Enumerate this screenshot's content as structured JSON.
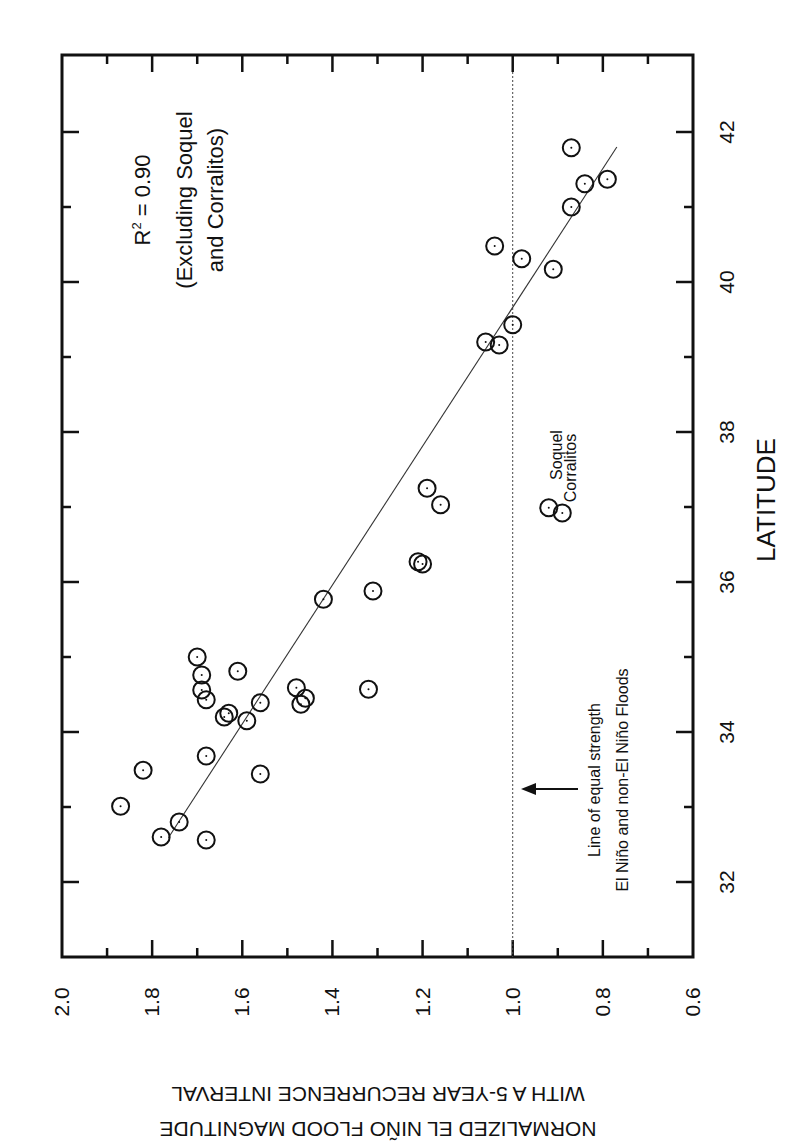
{
  "chart_data": {
    "type": "scatter",
    "orientation_note": "figure rotated 90 degrees clockwise on page",
    "title": "",
    "xlabel": "LATITUDE",
    "ylabel": [
      "NORMALIZED EL NIÑO FLOOD MAGNITUDE",
      "WITH A 5-YEAR RECURRENCE INTERVAL"
    ],
    "xlim": [
      31.0,
      43.0
    ],
    "ylim": [
      0.6,
      2.0
    ],
    "x_ticks": [
      32,
      34,
      36,
      38,
      40,
      42
    ],
    "x_minor_ticks": [
      33,
      35,
      37,
      39,
      41
    ],
    "y_ticks": [
      "2.0",
      "1.8",
      "1.6",
      "1.4",
      "1.2",
      "1.0",
      "0.8",
      "0.6"
    ],
    "y_tick_values": [
      2.0,
      1.8,
      1.6,
      1.4,
      1.2,
      1.0,
      0.8,
      0.6
    ],
    "y_minor_ticks": [
      1.9,
      1.7,
      1.5,
      1.3,
      1.1,
      0.9,
      0.7
    ],
    "grid": false,
    "series": [
      {
        "name": "Stations",
        "marker": "circle-dot",
        "points": [
          {
            "x": 35.0,
            "y": 1.7
          },
          {
            "x": 34.76,
            "y": 1.69
          },
          {
            "x": 34.56,
            "y": 1.69
          },
          {
            "x": 34.43,
            "y": 1.68
          },
          {
            "x": 34.81,
            "y": 1.61
          },
          {
            "x": 34.25,
            "y": 1.63
          },
          {
            "x": 34.2,
            "y": 1.64
          },
          {
            "x": 34.15,
            "y": 1.59
          },
          {
            "x": 34.39,
            "y": 1.56
          },
          {
            "x": 33.68,
            "y": 1.68
          },
          {
            "x": 33.49,
            "y": 1.82
          },
          {
            "x": 33.44,
            "y": 1.56
          },
          {
            "x": 33.01,
            "y": 1.87
          },
          {
            "x": 32.8,
            "y": 1.74
          },
          {
            "x": 32.6,
            "y": 1.78
          },
          {
            "x": 32.56,
            "y": 1.68
          },
          {
            "x": 37.25,
            "y": 1.19
          },
          {
            "x": 37.03,
            "y": 1.16
          },
          {
            "x": 36.27,
            "y": 1.21
          },
          {
            "x": 36.24,
            "y": 1.2
          },
          {
            "x": 35.88,
            "y": 1.31
          },
          {
            "x": 35.77,
            "y": 1.42
          },
          {
            "x": 34.57,
            "y": 1.32
          },
          {
            "x": 34.59,
            "y": 1.48
          },
          {
            "x": 34.45,
            "y": 1.46
          },
          {
            "x": 34.37,
            "y": 1.47
          },
          {
            "x": 41.79,
            "y": 0.87
          },
          {
            "x": 41.37,
            "y": 0.79
          },
          {
            "x": 41.31,
            "y": 0.84
          },
          {
            "x": 41.0,
            "y": 0.87
          },
          {
            "x": 40.48,
            "y": 1.04
          },
          {
            "x": 40.31,
            "y": 0.98
          },
          {
            "x": 40.17,
            "y": 0.91
          },
          {
            "x": 39.43,
            "y": 1.0
          },
          {
            "x": 39.2,
            "y": 1.06
          },
          {
            "x": 39.16,
            "y": 1.03
          }
        ]
      },
      {
        "name": "Excluded outliers",
        "marker": "circle-dot",
        "points": [
          {
            "x": 36.99,
            "y": 0.92,
            "label": "Soquel"
          },
          {
            "x": 36.92,
            "y": 0.89,
            "label": "Corralitos"
          }
        ]
      }
    ],
    "regression_line": {
      "x": [
        32.59,
        41.8
      ],
      "y": [
        1.764,
        0.769
      ],
      "style": "solid thin"
    },
    "reference_line": {
      "y": 1.0,
      "style": "dotted",
      "label": [
        "Line of equal strength",
        "El Niño and non-El Niño Floods"
      ]
    },
    "annotations": [
      {
        "text": "R² = 0.90",
        "r_label": "R",
        "sup": "2",
        "rest": " = 0.90"
      },
      {
        "text": "(Excluding Soquel"
      },
      {
        "text": "and Corralitos)"
      }
    ]
  },
  "labels": {
    "xlabel": "LATITUDE",
    "ylabel1": "NORMALIZED EL NIÑO FLOOD MAGNITUDE",
    "ylabel2": "WITH A 5-YEAR RECURRENCE INTERVAL",
    "r2_prefix": "R",
    "r2_sup": "2",
    "r2_rest": " = 0.90",
    "excl1": "(Excluding Soquel",
    "excl2": "and Corralitos)",
    "ref1": "Line of equal strength",
    "ref2": "El Niño and non-El Niño Floods",
    "soquel": "Soquel",
    "corralitos": "Corralitos"
  }
}
